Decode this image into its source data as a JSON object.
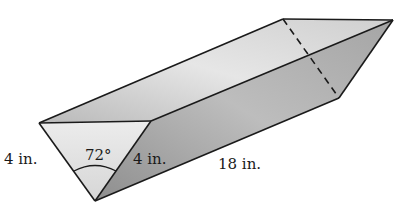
{
  "figure": {
    "type": "triangular-prism",
    "labels": {
      "left_side": "4 in.",
      "right_side": "4 in.",
      "angle": "72°",
      "length": "18 in."
    },
    "colors": {
      "edge": "#1a1a1a",
      "front_face": "#e2e2e2",
      "top_face": "#cfcfcf",
      "side_face": "#a9a9a9",
      "back_face": "#d8d8d8"
    }
  }
}
